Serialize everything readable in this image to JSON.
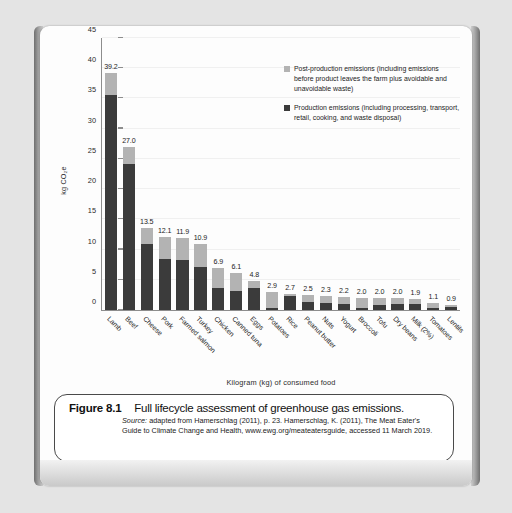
{
  "chart_data": {
    "type": "bar",
    "subtype": "stacked-bar",
    "title": "",
    "xlabel": "Kilogram (kg) of consumed food",
    "ylabel": "kg CO2e",
    "ylabel_display": "kg CO₂e",
    "ylim": [
      0,
      45
    ],
    "yticks": [
      0,
      5,
      10,
      15,
      20,
      25,
      30,
      35,
      40,
      45
    ],
    "grid": true,
    "legend_position": "top-right",
    "categories": [
      "Lamb",
      "Beef",
      "Cheese",
      "Pork",
      "Farmed salmon",
      "Turkey",
      "Chicken",
      "Canned tuna",
      "Eggs",
      "Potatoes",
      "Rice",
      "Peanut butter",
      "Nuts",
      "Yogurt",
      "Broccoli",
      "Tofu",
      "Dry beans",
      "Milk (2%)",
      "Tomatoes",
      "Lentils"
    ],
    "totals": [
      39.2,
      27.0,
      13.5,
      12.1,
      11.9,
      10.9,
      6.9,
      6.1,
      4.8,
      2.9,
      2.7,
      2.5,
      2.3,
      2.2,
      2.0,
      2.0,
      2.0,
      1.9,
      1.1,
      0.9
    ],
    "total_labels": [
      "39.2",
      "27.0",
      "13.5",
      "12.1",
      "11.9",
      "10.9",
      "6.9",
      "6.1",
      "4.8",
      "2.9",
      "2.7",
      "2.5",
      "2.3",
      "2.2",
      "2.0",
      "2.0",
      "2.0",
      "1.9",
      "1.1",
      "0.9"
    ],
    "series": [
      {
        "name": "Production emissions",
        "color": "#3b3b3b",
        "values": [
          35.5,
          24.2,
          11.0,
          8.5,
          8.3,
          7.1,
          3.6,
          3.2,
          3.7,
          0.3,
          2.4,
          1.3,
          1.1,
          1.0,
          0.4,
          0.9,
          1.0,
          1.0,
          0.4,
          0.5
        ]
      },
      {
        "name": "Post-production emissions",
        "color": "#b3b3b3",
        "values": [
          3.7,
          2.8,
          2.5,
          3.6,
          3.6,
          3.8,
          3.3,
          2.9,
          1.1,
          2.6,
          0.3,
          1.2,
          1.2,
          1.2,
          1.6,
          1.1,
          1.0,
          0.9,
          0.7,
          0.4
        ]
      }
    ],
    "legend": [
      {
        "color": "#b3b3b3",
        "label": "Post-production emissions (including emissions before product leaves the farm plus avoidable and unavoidable waste)"
      },
      {
        "color": "#3b3b3b",
        "label": "Production emissions (including processing, transport, retail, cooking, and waste disposal)"
      }
    ]
  },
  "caption": {
    "figure_number": "Figure 8.1",
    "title": "Full lifecycle assessment of greenhouse gas emissions.",
    "source_word": "Source:",
    "source_text": " adapted from Hamerschlag (2011), p. 23. Hamerschlag, K. (2011), The Meat Eater's Guide to Climate Change and Health, www.ewg.org/meateatersguide, accessed 11 March 2019."
  },
  "colors": {
    "production": "#3b3b3b",
    "post_production": "#b3b3b3",
    "axis": "#8d8d8d",
    "page": "#fdfdfd"
  }
}
